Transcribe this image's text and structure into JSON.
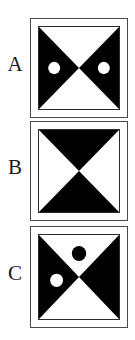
{
  "figure": {
    "width": 135,
    "height": 340,
    "background_color": "#ffffff",
    "ink_color": "#000000",
    "frame_color": "#4a4a4a",
    "inner_frame_color": "#2b2b2b",
    "label_color": "#1a1a1a"
  },
  "panels": [
    {
      "id": "panel-a",
      "label": "A",
      "frame": {
        "left": 30,
        "top": 18,
        "size": 98
      },
      "motif": "horizontal-bowtie",
      "motif_description": "Black triangles pointing inward from the left and right edges; white triangles at top and bottom",
      "triangles": [
        {
          "name": "left-black-triangle",
          "fill": "#000000",
          "points": "0,0 0,100 50,50"
        },
        {
          "name": "right-black-triangle",
          "fill": "#000000",
          "points": "100,0 100,100 50,50"
        }
      ],
      "dots": [
        {
          "name": "left-white-dot",
          "fill": "#ffffff",
          "cx": 19,
          "cy": 50,
          "r": 7.5
        },
        {
          "name": "right-white-dot",
          "fill": "#ffffff",
          "cx": 81,
          "cy": 50,
          "r": 7.5
        }
      ]
    },
    {
      "id": "panel-b",
      "label": "B",
      "frame": {
        "left": 30,
        "top": 121,
        "size": 98
      },
      "motif": "vertical-bowtie",
      "motif_description": "Black triangles pointing inward from the top and bottom edges; white triangles at left and right",
      "triangles": [
        {
          "name": "top-black-triangle",
          "fill": "#000000",
          "points": "0,0 100,0 50,50"
        },
        {
          "name": "bottom-black-triangle",
          "fill": "#000000",
          "points": "0,100 100,100 50,50"
        }
      ],
      "dots": [
        {
          "name": "top-black-dot",
          "fill": "#000000",
          "cx": 50,
          "cy": 20,
          "r": 9
        },
        {
          "name": "bottom-black-dot",
          "fill": "#000000",
          "cx": 50,
          "cy": 80,
          "r": 9
        }
      ]
    },
    {
      "id": "panel-c",
      "label": "C",
      "frame": {
        "left": 30,
        "top": 226,
        "size": 98
      },
      "motif": "horizontal-bowtie",
      "motif_description": "Black triangles pointing inward from the left and right edges; one black dot in the upper white triangle and one white dot in the left black triangle",
      "triangles": [
        {
          "name": "left-black-triangle",
          "fill": "#000000",
          "points": "0,0 0,100 50,50"
        },
        {
          "name": "right-black-triangle",
          "fill": "#000000",
          "points": "100,0 100,100 50,50"
        }
      ],
      "dots": [
        {
          "name": "top-black-dot",
          "fill": "#000000",
          "cx": 50,
          "cy": 22,
          "r": 9
        },
        {
          "name": "left-white-dot",
          "fill": "#ffffff",
          "cx": 22,
          "cy": 54,
          "r": 8
        }
      ]
    }
  ]
}
